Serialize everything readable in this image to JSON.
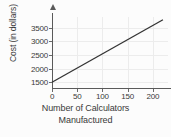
{
  "chart_data": {
    "type": "line",
    "title": "",
    "xlabel_lines": [
      "Number of Calculators",
      "Manufactured"
    ],
    "xlabel": "Number of Calculators Manufactured",
    "ylabel": "Cost (in dollars)",
    "xlim": [
      0,
      230
    ],
    "ylim": [
      1250,
      3900
    ],
    "xticks": [
      0,
      50,
      100,
      150,
      200
    ],
    "yticks": [
      1500,
      2000,
      2500,
      3000,
      3500
    ],
    "xtick_labels": [
      "0",
      "50",
      "100",
      "150",
      "200"
    ],
    "ytick_labels": [
      "1500",
      "2000",
      "2500",
      "3000",
      "3500"
    ],
    "grid": true,
    "legend": "none",
    "series": [
      {
        "name": "Cost",
        "x": [
          0,
          220
        ],
        "y": [
          1500,
          3800
        ],
        "intercept": 1500,
        "slope": 10.45,
        "color": "#333333"
      }
    ]
  },
  "colors": {
    "axis": "#5a5a5a",
    "grid": "#ececec",
    "line": "#333333",
    "text": "#3a3a3a",
    "background": "#fcfcfc"
  }
}
